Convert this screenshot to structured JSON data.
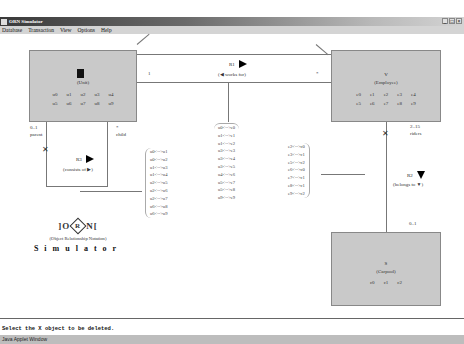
{
  "window": {
    "title": "ORN Simulator",
    "controls": [
      "_",
      "□",
      "×"
    ]
  },
  "menubar": {
    "items": [
      "Database",
      "Transaction",
      "View",
      "Options",
      "Help"
    ]
  },
  "objects": {
    "unit": {
      "name": "U",
      "label": "(Unit)",
      "instances": [
        "u0",
        "u1",
        "u2",
        "u3",
        "u4",
        "u5",
        "u6",
        "u7",
        "u8",
        "u9"
      ],
      "selected": true
    },
    "employee": {
      "name": "V",
      "label": "(Employee)",
      "instances": [
        "e0",
        "e1",
        "e2",
        "e3",
        "e4",
        "e5",
        "e6",
        "e7",
        "e8",
        "e9"
      ]
    },
    "carpool": {
      "name": "S",
      "label": "(Carpool)",
      "instances": [
        "c0",
        "c1",
        "c2"
      ]
    }
  },
  "relationships": {
    "r1": {
      "name": "R1",
      "reading": "(◀ works for)",
      "card_left": "1",
      "card_right": "*"
    },
    "r2": {
      "name": "R2",
      "reading": "(belongs to ▼)",
      "card_top": "2..15",
      "role_top": "riders",
      "card_bottom": "0..1"
    },
    "r3": {
      "name": "R3",
      "reading": "(consists of ▶)",
      "card_parent": "0..1",
      "role_parent": "parent",
      "card_child": "*",
      "role_child": "child"
    }
  },
  "pairs": {
    "r3_pairs": [
      "u0<-->u1",
      "u0<-->u2",
      "u1<-->u3",
      "u1<-->u4",
      "u2<-->u5",
      "u2<-->u6",
      "u2<-->u7",
      "u6<-->u8",
      "u6<-->u9"
    ],
    "r1_pairs": [
      "u0<-->e0",
      "u1<-->e1",
      "u1<-->e2",
      "u3<-->e3",
      "u3<-->e4",
      "u3<-->e5",
      "u4<-->e6",
      "u5<-->e7",
      "u5<-->e8",
      "u9<-->e9"
    ],
    "r2_pairs": [
      "e2<-->c0",
      "e3<-->c1",
      "e5<-->c2",
      "e6<-->c0",
      "e7<-->c1",
      "e8<-->c1",
      "e9<-->c2"
    ]
  },
  "logo": {
    "left": "]O",
    "center": "R",
    "right": "N[",
    "subtitle": "(Object Relationship Notation)",
    "product": "Simulator"
  },
  "status": {
    "message": "Select the X object to be deleted."
  },
  "applet_bar": {
    "label": "Java Applet Window"
  }
}
